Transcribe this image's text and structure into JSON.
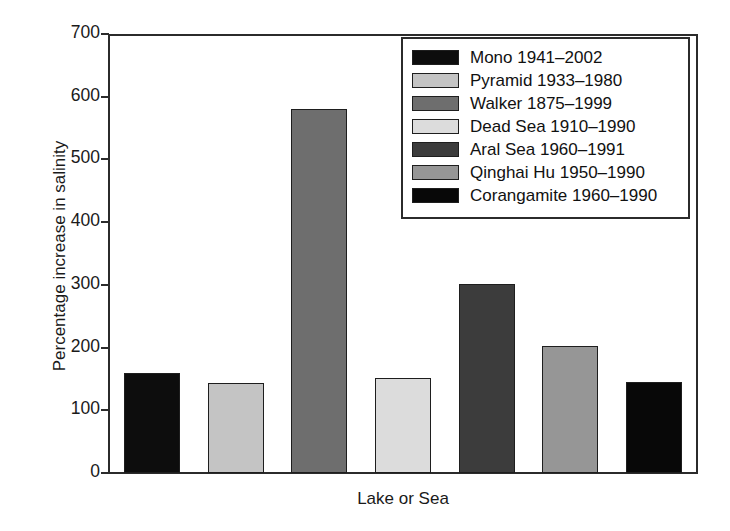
{
  "chart_data": {
    "type": "bar",
    "title": "",
    "xlabel": "Lake or Sea",
    "ylabel": "Percentage increase in salinity",
    "ylim": [
      0,
      700
    ],
    "ytick_values": [
      0,
      100,
      200,
      300,
      400,
      500,
      600,
      700
    ],
    "ytick_labels": [
      "0",
      "100",
      "200",
      "300",
      "400",
      "500",
      "600",
      "700"
    ],
    "grid": false,
    "legend_position": "upper right",
    "categories": [
      "Mono 1941–2002",
      "Pyramid 1933–1980",
      "Walker 1875–1999",
      "Dead Sea 1910–1990",
      "Aral Sea 1960–1991",
      "Qinghai Hu 1950–1990",
      "Corangamite 1960–1990"
    ],
    "values": [
      160,
      144,
      580,
      152,
      302,
      202,
      145
    ],
    "colors": [
      "#0d0d0d",
      "#c4c4c4",
      "#6e6e6e",
      "#dcdcdc",
      "#3c3c3c",
      "#969696",
      "#080808"
    ],
    "bar_edge_color": "#1e1e1e"
  },
  "legend": {
    "items": [
      {
        "label": "Mono 1941–2002",
        "color": "#0d0d0d"
      },
      {
        "label": "Pyramid 1933–1980",
        "color": "#c4c4c4"
      },
      {
        "label": "Walker 1875–1999",
        "color": "#6e6e6e"
      },
      {
        "label": "Dead Sea 1910–1990",
        "color": "#dcdcdc"
      },
      {
        "label": "Aral Sea 1960–1991",
        "color": "#3c3c3c"
      },
      {
        "label": "Qinghai Hu 1950–1990",
        "color": "#969696"
      },
      {
        "label": "Corangamite 1960–1990",
        "color": "#080808"
      }
    ]
  }
}
